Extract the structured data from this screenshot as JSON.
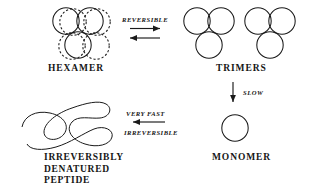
{
  "diagram": {
    "stroke_color": "#1a1a1a",
    "background_color": "#ffffff",
    "structures": [
      {
        "id": "hexamer",
        "label": "HEXAMER",
        "subunit_count": 6,
        "description": "Six circles, front three drawn solid and rear three drawn dashed, stacked two over one"
      },
      {
        "id": "trimers",
        "label": "TRIMERS",
        "subunit_count": 3,
        "copies": 2,
        "description": "Two separate trimers, each three solid circles arranged two over one"
      },
      {
        "id": "monomer",
        "label": "MONOMER",
        "subunit_count": 1,
        "description": "Single solid circle"
      },
      {
        "id": "denatured-peptide",
        "label": "IRREVERSIBLY DENATURED PEPTIDE",
        "label_lines": [
          "IRREVERSIBLY",
          "DENATURED",
          "PEPTIDE"
        ],
        "description": "Open random-coil squiggle representing an unfolded polypeptide chain"
      }
    ],
    "arrows": [
      {
        "id": "hexamer-trimers",
        "label": "REVERSIBLE",
        "direction": "double-horizontal",
        "from": "hexamer",
        "to": "trimers"
      },
      {
        "id": "trimers-monomer",
        "label": "SLOW",
        "direction": "down",
        "from": "trimers",
        "to": "monomer"
      },
      {
        "id": "monomer-denatured",
        "label_top": "VERY FAST",
        "label_bottom": "IRREVERSIBLE",
        "direction": "left",
        "from": "monomer",
        "to": "denatured-peptide"
      }
    ]
  }
}
